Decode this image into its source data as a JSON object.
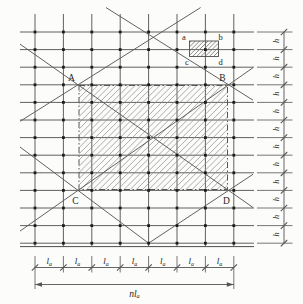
{
  "figure": {
    "type": "structural-grid-diagram",
    "labels": {
      "panel_corners": [
        "A",
        "B",
        "C",
        "D"
      ],
      "cell_corners": [
        "a",
        "b",
        "c",
        "d"
      ],
      "row_spacing": "h",
      "col_spacing_base": "l",
      "col_spacing_sub": "a",
      "total_width_base": "nl",
      "total_width_sub": "a"
    },
    "counts": {
      "grid_cols": 8,
      "grid_rows": 13,
      "col_intervals": 7,
      "row_intervals": 12
    },
    "colors": {
      "background": "#fcfcfa",
      "grid_line": "#4e4e4e",
      "diagonal_line": "#585858",
      "dim_line": "#555555",
      "hatch": "#909090",
      "cell_hatch": "#6f6f6f",
      "dot": "#1d1d1d",
      "text": "#242424"
    }
  }
}
